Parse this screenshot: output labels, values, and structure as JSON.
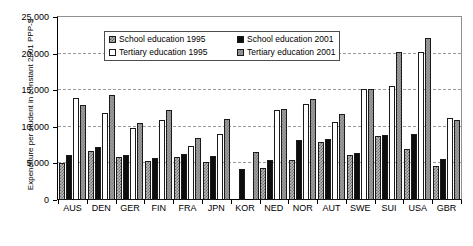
{
  "chart_data": {
    "type": "bar",
    "title": "",
    "xlabel": "",
    "ylabel": "Expenditure per student in constant 2001 PPP-$",
    "ylim": [
      0,
      25000
    ],
    "ytick_labels": [
      "25,000",
      "20,000",
      "15,000",
      "10,000",
      "5,000",
      "0"
    ],
    "ytick_values": [
      25000,
      20000,
      15000,
      10000,
      5000,
      0
    ],
    "grid": true,
    "legend_position": "top-center",
    "categories": [
      "AUS",
      "DEN",
      "GER",
      "FIN",
      "FRA",
      "JPN",
      "KOR",
      "NED",
      "NOR",
      "AUT",
      "SWE",
      "SUI",
      "USA",
      "GBR"
    ],
    "series": [
      {
        "name": "School education 1995",
        "key": "s95",
        "values": [
          5000,
          6700,
          5900,
          5300,
          5900,
          5200,
          null,
          4400,
          5400,
          7900,
          6200,
          8700,
          7000,
          4700
        ]
      },
      {
        "name": "School education 2001",
        "key": "s01",
        "values": [
          6100,
          7300,
          6100,
          5700,
          6300,
          6000,
          4300,
          5400,
          8200,
          8300,
          6400,
          8900,
          9000,
          5600
        ]
      },
      {
        "name": "Tertiary education 1995",
        "key": "t95",
        "values": [
          13900,
          11900,
          9900,
          10900,
          7400,
          9000,
          null,
          12300,
          13100,
          10700,
          15100,
          15600,
          20200,
          11200
        ]
      },
      {
        "name": "Tertiary education 2001",
        "key": "t01",
        "values": [
          13000,
          14300,
          10500,
          12300,
          8500,
          11000,
          6600,
          12500,
          13800,
          11700,
          15100,
          20200,
          22200,
          10900
        ]
      }
    ]
  },
  "legend": {
    "items": [
      {
        "label": "School education 1995",
        "key": "s95"
      },
      {
        "label": "School education 2001",
        "key": "s01"
      },
      {
        "label": "Tertiary education 1995",
        "key": "t95"
      },
      {
        "label": "Tertiary education 2001",
        "key": "t01"
      }
    ]
  },
  "colors": {
    "school_1995": "#b9b9b9",
    "school_2001": "#0d0d0d",
    "tertiary_1995": "#ffffff",
    "tertiary_2001": "#9e9e9e",
    "axis": "#000000",
    "grid": "#9a9a9a",
    "background": "#ffffff"
  }
}
